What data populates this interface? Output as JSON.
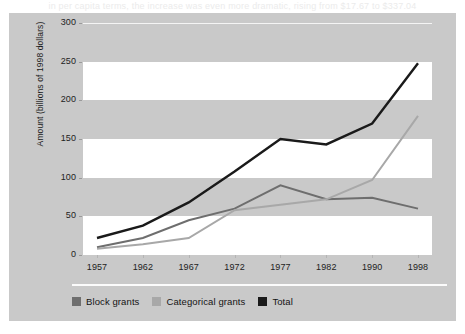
{
  "caption_ghost": "in per capita terms, the increase was even more dramatic, rising from $17.67 to $337.04",
  "chart_data": {
    "type": "line",
    "title": "",
    "xlabel": "",
    "ylabel": "Amount (billions of 1998 dollars)",
    "categories": [
      "1957",
      "1962",
      "1967",
      "1972",
      "1977",
      "1982",
      "1990",
      "1998"
    ],
    "ylim": [
      0,
      300
    ],
    "yticks": [
      0,
      50,
      100,
      150,
      200,
      250,
      300
    ],
    "grid": "horizontal-bands",
    "legend_position": "bottom-left",
    "series": [
      {
        "name": "Block grants",
        "color": "#6e6e6e",
        "values": [
          10,
          22,
          45,
          60,
          90,
          72,
          74,
          60
        ]
      },
      {
        "name": "Categorical grants",
        "color": "#a8a8a8",
        "values": [
          8,
          14,
          22,
          58,
          65,
          72,
          97,
          180
        ]
      },
      {
        "name": "Total",
        "color": "#1a1a1a",
        "values": [
          22,
          38,
          68,
          108,
          150,
          143,
          170,
          248
        ]
      }
    ]
  },
  "axis": {
    "y_title": "Amount (billions of 1998 dollars)",
    "y_labels": [
      "300",
      "250",
      "200",
      "150",
      "100",
      "50",
      "0"
    ],
    "x_labels": [
      "1957",
      "1962",
      "1967",
      "1972",
      "1977",
      "1982",
      "1990",
      "1998"
    ]
  },
  "legend": {
    "items": [
      {
        "label": "Block grants",
        "color": "#6e6e6e"
      },
      {
        "label": "Categorical grants",
        "color": "#a8a8a8"
      },
      {
        "label": "Total",
        "color": "#1a1a1a"
      }
    ]
  },
  "colors": {
    "figure_background": "#c9c9c9",
    "band_white": "#ffffff",
    "block_grants": "#6e6e6e",
    "categorical_grants": "#a8a8a8",
    "total": "#1a1a1a"
  }
}
